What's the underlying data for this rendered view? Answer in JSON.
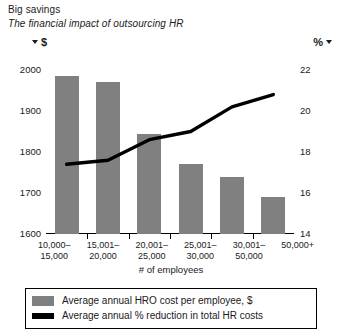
{
  "header": {
    "title": "Big savings",
    "subtitle": "The financial impact of outsourcing HR",
    "left_unit": "$",
    "right_unit": "%",
    "left_marker_icon": "triangle-down-icon",
    "right_marker_icon": "triangle-down-icon"
  },
  "colors": {
    "bar": "#808080",
    "line": "#000000",
    "text": "#1a1a1a",
    "background": "#ffffff"
  },
  "legend": {
    "items": [
      {
        "label": "Average annual HRO cost per employee, $",
        "swatch": "bar",
        "color": "#808080"
      },
      {
        "label": "Average annual % reduction in total HR costs",
        "swatch": "line",
        "color": "#000000"
      }
    ]
  },
  "chart_data": {
    "type": "bar",
    "title": "Big savings",
    "subtitle": "The financial impact of outsourcing HR",
    "xlabel": "# of employees",
    "ylabel": "$",
    "y2label": "%",
    "categories": [
      "10,000–\n15,000",
      "15,001–\n20,000",
      "20,001–\n25,000",
      "25,001–\n30,000",
      "30,001–\n50,000",
      "50,000+"
    ],
    "category_lines": [
      [
        "10,000–",
        "15,000"
      ],
      [
        "15,001–",
        "20,000"
      ],
      [
        "20,001–",
        "25,000"
      ],
      [
        "25,001–",
        "30,000"
      ],
      [
        "30,001–",
        "50,000"
      ],
      [
        "50,000+",
        ""
      ]
    ],
    "ylim": [
      1600,
      2000
    ],
    "yticks": [
      2000,
      1900,
      1800,
      1700,
      1600
    ],
    "y2lim": [
      14,
      22
    ],
    "y2ticks": [
      22,
      20,
      18,
      16,
      14
    ],
    "grid": false,
    "legend_position": "bottom",
    "series": [
      {
        "name": "Average annual HRO cost per employee, $",
        "type": "bar",
        "axis": "left",
        "color": "#808080",
        "values": [
          1985,
          1970,
          1845,
          1770,
          1740,
          1690
        ]
      },
      {
        "name": "Average annual % reduction in total HR costs",
        "type": "line",
        "axis": "right",
        "color": "#000000",
        "values": [
          17.4,
          17.6,
          18.6,
          19.0,
          20.2,
          20.8
        ]
      }
    ]
  }
}
